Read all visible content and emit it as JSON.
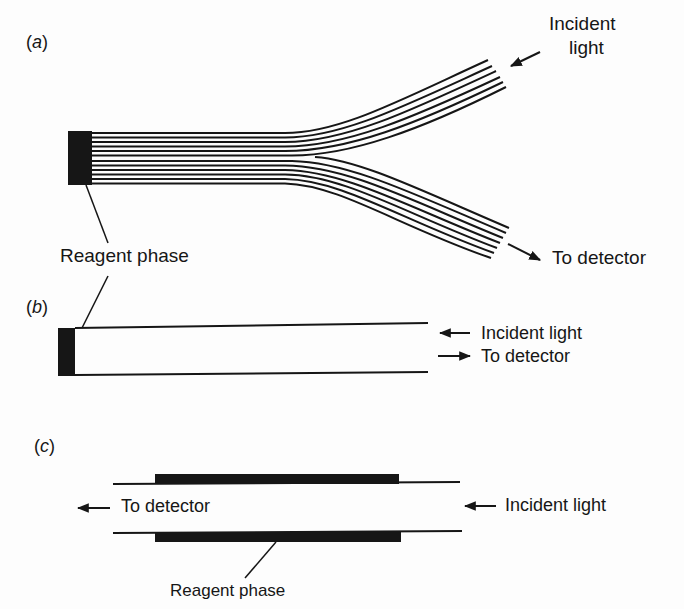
{
  "figure": {
    "panels": [
      {
        "id": "a",
        "tag_open": "(",
        "tag_letter": "a",
        "tag_close": ")",
        "description": "Bifurcated fiber-optic bundle with reagent phase at common end",
        "labels": {
          "incident_line1": "Incident",
          "incident_line2": "light",
          "detector": "To detector",
          "reagent": "Reagent phase"
        },
        "fibers_common": 12,
        "fibers_per_branch": 6
      },
      {
        "id": "b",
        "tag_open": "(",
        "tag_letter": "b",
        "tag_close": ")",
        "description": "Single fiber with reagent phase at tip",
        "labels": {
          "incident": "Incident light",
          "detector": "To detector"
        }
      },
      {
        "id": "c",
        "tag_open": "(",
        "tag_letter": "c",
        "tag_close": ")",
        "description": "Fiber with reagent phase as cladding (evanescent wave sensor)",
        "labels": {
          "detector": "To detector",
          "incident": "Incident light",
          "reagent": "Reagent phase"
        }
      }
    ],
    "colors": {
      "ink": "#161616",
      "background": "#fdfdfd"
    }
  }
}
